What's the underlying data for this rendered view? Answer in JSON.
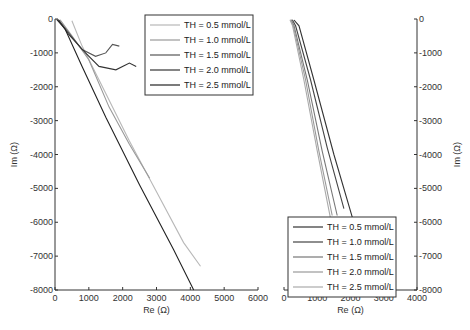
{
  "chart_data": [
    {
      "type": "line",
      "panel": "left",
      "title": "",
      "xlabel": "Re (Ω)",
      "ylabel": "Im (Ω)",
      "xlim": [
        0,
        6000
      ],
      "ylim": [
        -8000,
        0
      ],
      "xticks": [
        "0",
        "1000",
        "2000",
        "3000",
        "4000",
        "5000",
        "6000"
      ],
      "yticks": [
        "0",
        "-1000",
        "-2000",
        "-3000",
        "-4000",
        "-5000",
        "-6000",
        "-7000",
        "-8000"
      ],
      "y_axis_side": "left",
      "legend_position": "top-right",
      "grid": false,
      "series": [
        {
          "name": "TH = 0.5 mmol/L",
          "color": "#b8b8b8",
          "x": [
            500,
            800,
            1500,
            2200,
            3000,
            3800,
            4300
          ],
          "y": [
            -50,
            -800,
            -2200,
            -3600,
            -5100,
            -6600,
            -7300
          ]
        },
        {
          "name": "TH = 1.0 mmol/L",
          "color": "#999999",
          "x": [
            150,
            500,
            1000,
            1600,
            2200,
            2800
          ],
          "y": [
            -20,
            -500,
            -1200,
            -2600,
            -3700,
            -4700
          ]
        },
        {
          "name": "TH = 1.5 mmol/L",
          "color": "#555555",
          "x": [
            100,
            400,
            800,
            1200,
            1500,
            1700,
            1900
          ],
          "y": [
            -20,
            -400,
            -900,
            -1100,
            -1000,
            -750,
            -800
          ]
        },
        {
          "name": "TH = 2.0 mmol/L",
          "color": "#333333",
          "x": [
            100,
            400,
            900,
            1300,
            1800,
            2200,
            2400
          ],
          "y": [
            -20,
            -450,
            -1000,
            -1400,
            -1500,
            -1300,
            -1400
          ]
        },
        {
          "name": "TH = 2.5 mmol/L",
          "color": "#222222",
          "x": [
            50,
            300,
            800,
            1500,
            2500,
            3500,
            4100
          ],
          "y": [
            -10,
            -300,
            -1400,
            -2900,
            -4900,
            -6800,
            -8000
          ]
        }
      ]
    },
    {
      "type": "line",
      "panel": "right",
      "title": "",
      "xlabel": "Re (Ω)",
      "ylabel": "Im (Ω)",
      "xlim": [
        0,
        4000
      ],
      "ylim": [
        -8000,
        0
      ],
      "xticks": [
        "0",
        "1000",
        "2000",
        "3000",
        "4000"
      ],
      "yticks": [
        "0",
        "-1000",
        "-2000",
        "-3000",
        "-4000",
        "-5000",
        "-6000",
        "-7000",
        "-8000"
      ],
      "y_axis_side": "right",
      "legend_position": "bottom",
      "grid": false,
      "series": [
        {
          "name": "TH = 0.5 mmol/L",
          "color": "#333333",
          "x": [
            300,
            450,
            900,
            1500,
            2100
          ],
          "y": [
            -30,
            -200,
            -1800,
            -4000,
            -6000
          ]
        },
        {
          "name": "TH = 1.0 mmol/L",
          "color": "#444444",
          "x": [
            250,
            350,
            800,
            1300,
            1800
          ],
          "y": [
            -20,
            -200,
            -1800,
            -3800,
            -5600
          ]
        },
        {
          "name": "TH = 1.5 mmol/L",
          "color": "#777777",
          "x": [
            220,
            300,
            700,
            1150,
            1600
          ],
          "y": [
            -20,
            -200,
            -1800,
            -3900,
            -5800
          ]
        },
        {
          "name": "TH = 2.0 mmol/L",
          "color": "#999999",
          "x": [
            200,
            280,
            650,
            1050,
            1450
          ],
          "y": [
            -20,
            -200,
            -1800,
            -3900,
            -5800
          ]
        },
        {
          "name": "TH = 2.5 mmol/L",
          "color": "#aaaaaa",
          "x": [
            180,
            260,
            600,
            1000,
            1400
          ],
          "y": [
            -20,
            -200,
            -1800,
            -3900,
            -5900
          ]
        }
      ]
    }
  ]
}
